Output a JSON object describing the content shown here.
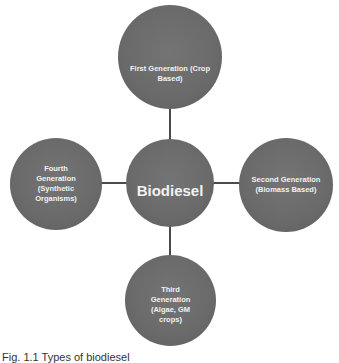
{
  "diagram": {
    "center": {
      "label": "Biodiesel"
    },
    "nodes": [
      {
        "position": "top",
        "label": "First Generation (Crop Based)"
      },
      {
        "position": "right",
        "label": "Second Generation (Biomass Based)"
      },
      {
        "position": "bottom",
        "label": "Third Generation (Algae, GM crops)"
      },
      {
        "position": "left",
        "label": "Fourth Generation (Synthetic Organisms)"
      }
    ],
    "colors": {
      "node_fill": "#6a6a6a",
      "node_text": "#f2f2f2",
      "connector": "#4a4a4a",
      "background": "#ffffff"
    }
  },
  "caption": "Fig. 1.1  Types of biodiesel"
}
